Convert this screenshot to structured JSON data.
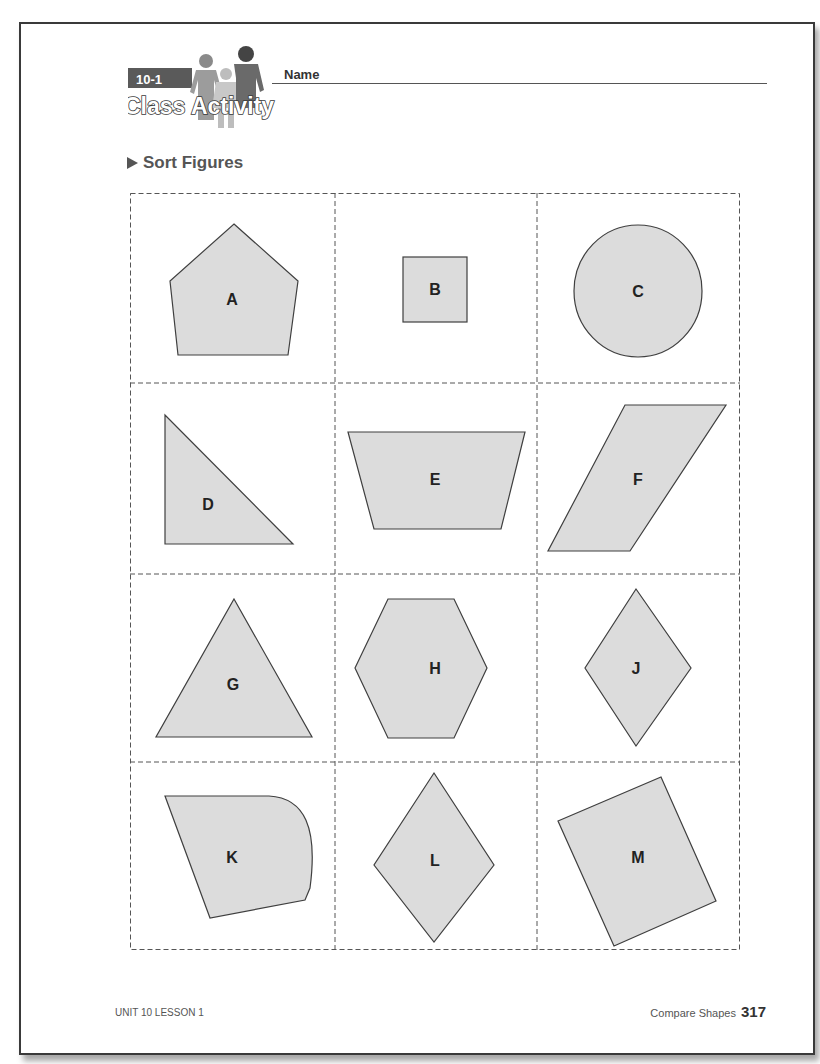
{
  "header": {
    "lesson_badge": "10-1",
    "activity_title": "Class Activity",
    "name_label": "Name"
  },
  "section": {
    "title": "Sort Figures",
    "bullet_icon": "triangle-right-icon"
  },
  "figures": [
    {
      "label": "A",
      "shape": "pentagon"
    },
    {
      "label": "B",
      "shape": "square"
    },
    {
      "label": "C",
      "shape": "circle"
    },
    {
      "label": "D",
      "shape": "right-triangle"
    },
    {
      "label": "E",
      "shape": "trapezoid"
    },
    {
      "label": "F",
      "shape": "parallelogram"
    },
    {
      "label": "G",
      "shape": "triangle"
    },
    {
      "label": "H",
      "shape": "hexagon"
    },
    {
      "label": "J",
      "shape": "rhombus"
    },
    {
      "label": "K",
      "shape": "curved-figure"
    },
    {
      "label": "L",
      "shape": "rhombus"
    },
    {
      "label": "M",
      "shape": "rotated-square"
    }
  ],
  "colors": {
    "shape_fill": "#dcdcdc",
    "shape_stroke": "#3f3f3f",
    "grid_dash": "#555555",
    "page_border": "#3a3a3a"
  },
  "footer": {
    "left": "UNIT 10 LESSON 1",
    "right_label": "Compare Shapes",
    "page_number": "317"
  }
}
